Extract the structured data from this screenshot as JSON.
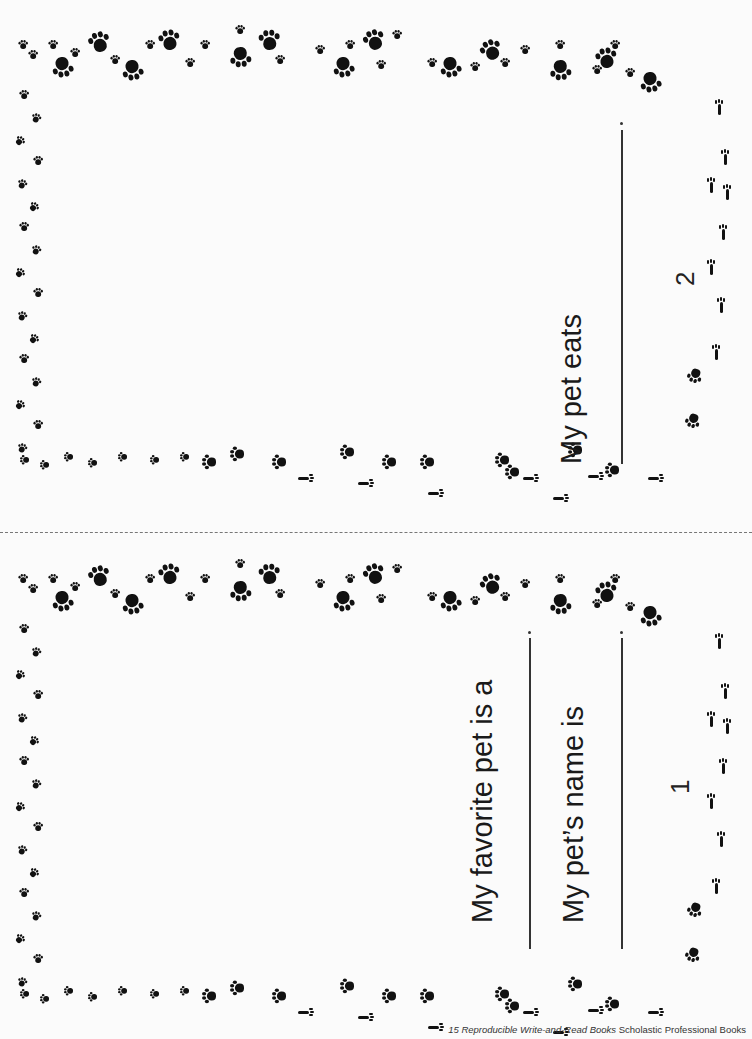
{
  "pages": [
    {
      "page_number": "2",
      "prompts": [
        {
          "label": "My pet eats",
          "blank": ""
        }
      ]
    },
    {
      "page_number": "1",
      "prompts": [
        {
          "label": "My favorite pet is a",
          "blank": ""
        },
        {
          "label": "My pet’s name is",
          "blank": ""
        }
      ]
    }
  ],
  "border": {
    "motif": "paw-print-icon",
    "color": "#111111"
  },
  "footer": {
    "title": "15 Reproducible Write-and-Read Books",
    "publisher": "Scholastic Professional Books"
  }
}
